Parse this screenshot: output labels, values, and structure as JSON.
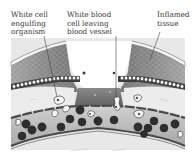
{
  "figure": {
    "labels": [
      {
        "id": "engulf",
        "text": "White cell\nengulfing\norganism"
      },
      {
        "id": "leaving",
        "text": "White blood\ncell leaving\nblood vessel"
      },
      {
        "id": "inflamed",
        "text": "Inflamed\ntissue"
      }
    ],
    "regions": [
      "skin-surface",
      "dermis-left",
      "dermis-right",
      "wound-gap",
      "epithelial-cell-row",
      "connective-tissue",
      "blood-vessel",
      "red-blood-cells",
      "white-blood-cells"
    ],
    "colors": {
      "skin_top": "#f2f2f2",
      "dermis_dark": "#5e5e5e",
      "dermis_cells": "#9a9a9a",
      "connective": "#e6e6e6",
      "vessel_wall": "#555555",
      "plasma": "#bdbdbd",
      "rbc": "#2e2e2e",
      "wbc": "#f4f4f4"
    }
  }
}
